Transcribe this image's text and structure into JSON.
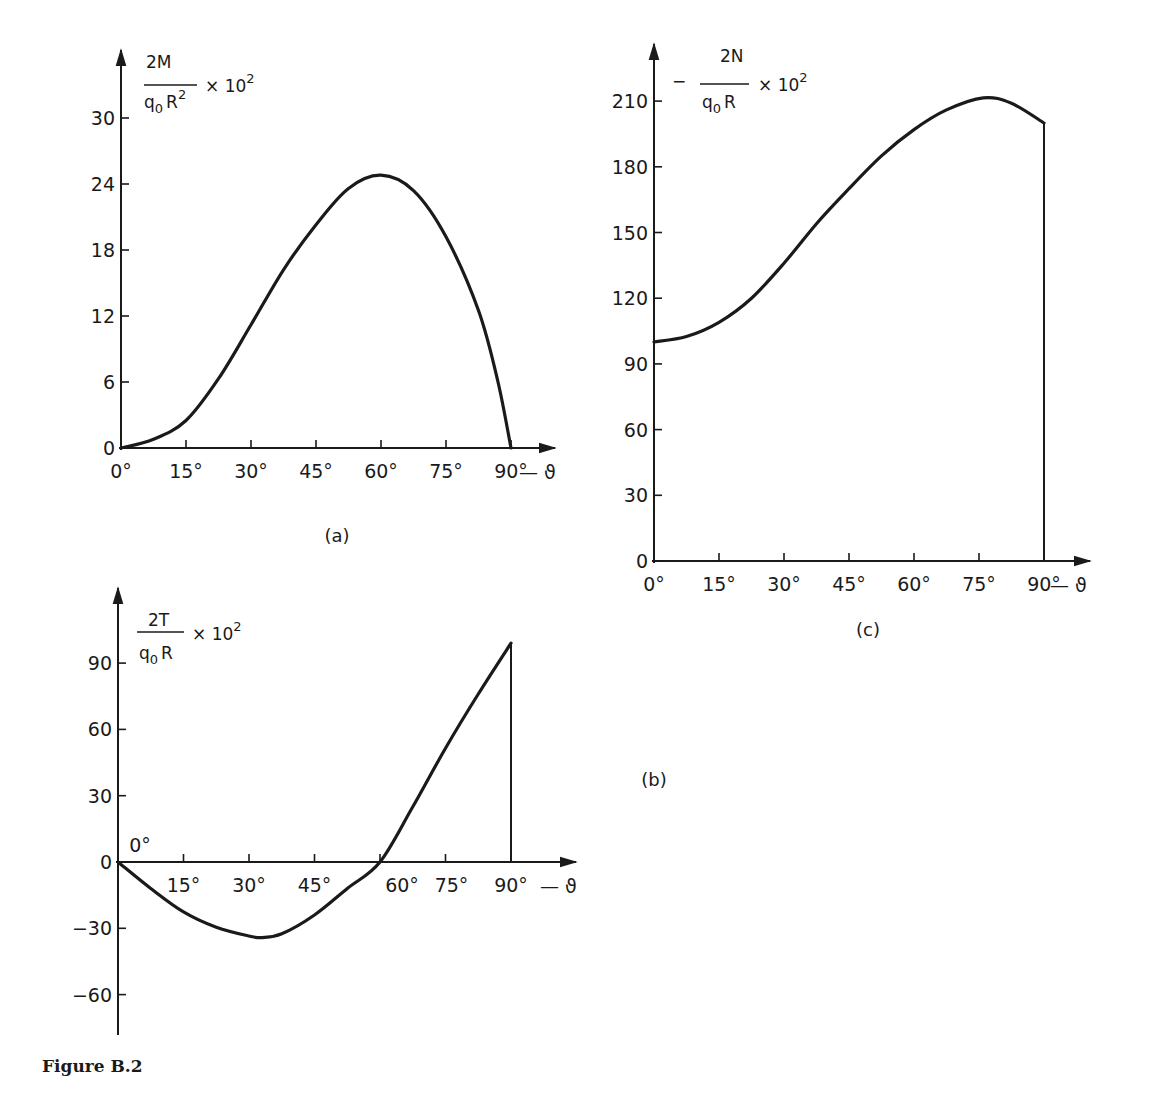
{
  "figure_caption": "Figure B.2",
  "chart_data": [
    {
      "id": "a",
      "type": "line",
      "panel_label": "(a)",
      "title": "",
      "ylabel": {
        "numerator": "2M",
        "denominator_base": "q",
        "denominator_sub": "0",
        "denominator_rest": "R",
        "denominator_sup": "2",
        "suffix": "× 10",
        "suffix_sup": "2",
        "prefix": ""
      },
      "xlabel": "— ϑ",
      "x_ticks": [
        "0°",
        "15°",
        "30°",
        "45°",
        "60°",
        "75°",
        "90°"
      ],
      "y_ticks": [
        "0",
        "6",
        "12",
        "18",
        "24",
        "30"
      ],
      "xlim": [
        0,
        90
      ],
      "ylim": [
        0,
        30
      ],
      "grid": false,
      "x": [
        0,
        7.5,
        15,
        22.5,
        30,
        37.5,
        45,
        52.5,
        60,
        67.5,
        75,
        82.5,
        87,
        90
      ],
      "values": [
        0,
        0.8,
        2.5,
        6.3,
        11.2,
        16.2,
        20.3,
        23.6,
        24.8,
        23.4,
        19.2,
        12.5,
        6,
        0
      ]
    },
    {
      "id": "b",
      "type": "line",
      "panel_label": "(b)",
      "title": "",
      "ylabel": {
        "numerator": "2T",
        "denominator_base": "q",
        "denominator_sub": "0",
        "denominator_rest": "R",
        "denominator_sup": "",
        "suffix": "× 10",
        "suffix_sup": "2",
        "prefix": ""
      },
      "xlabel": "— ϑ",
      "x_ticks": [
        "0°",
        "15°",
        "30°",
        "45°",
        "60°",
        "75°",
        "90°"
      ],
      "y_ticks": [
        "−60",
        "−30",
        "0",
        "30",
        "60",
        "90"
      ],
      "xlim": [
        0,
        90
      ],
      "ylim": [
        -75,
        105
      ],
      "grid": false,
      "x": [
        0,
        7.5,
        15,
        22.5,
        30,
        33,
        37.5,
        45,
        52.5,
        60,
        67.5,
        75,
        82.5,
        90
      ],
      "values": [
        0,
        -12,
        -22.6,
        -29.5,
        -33.5,
        -34.2,
        -32.5,
        -24,
        -12,
        0,
        25,
        51.5,
        76,
        99
      ]
    },
    {
      "id": "c",
      "type": "line",
      "panel_label": "(c)",
      "title": "",
      "ylabel": {
        "numerator": "2N",
        "denominator_base": "q",
        "denominator_sub": "0",
        "denominator_rest": "R",
        "denominator_sup": "",
        "suffix": "× 10",
        "suffix_sup": "2",
        "prefix": "−"
      },
      "xlabel": "— ϑ",
      "x_ticks": [
        "0°",
        "15°",
        "30°",
        "45°",
        "60°",
        "75°",
        "90°"
      ],
      "y_ticks": [
        "0",
        "30",
        "60",
        "90",
        "120",
        "150",
        "180",
        "210"
      ],
      "xlim": [
        0,
        90
      ],
      "ylim": [
        0,
        210
      ],
      "grid": false,
      "x": [
        0,
        7.5,
        15,
        22.5,
        30,
        37.5,
        45,
        52.5,
        60,
        67.5,
        76,
        82.5,
        90
      ],
      "values": [
        100,
        102.5,
        109,
        120,
        136,
        154,
        170,
        185,
        197,
        206,
        211.5,
        209,
        200
      ]
    }
  ]
}
